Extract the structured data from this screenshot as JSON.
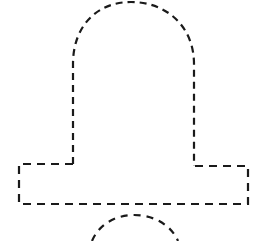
{
  "canvas": {
    "width": 268,
    "height": 241,
    "background_color": "#ffffff",
    "title": "Bell Outline"
  },
  "drawing": {
    "name": "bell-outline",
    "description": "Dashed outline drawing of a bell",
    "style": {
      "stroke_color": "#1a1a1a",
      "stroke_width": 2.2,
      "dash_pattern": "7 5",
      "fill": "none"
    },
    "shapes": {
      "dome": {
        "name": "bell-dome",
        "path": "M 73 164 L 73 64 C 73 26 97 2 131 2 C 166 2 194 26 194 64 L 194 166",
        "dash_pattern": "7 5"
      },
      "base_flange": {
        "name": "bell-base-flange",
        "path": "M 73 164 L 19 164 L 19 204 L 248 204 L 248 166 L 194 166",
        "dash_pattern": "8 6"
      },
      "clapper": {
        "name": "bell-clapper",
        "path": "M 92 241 C 99 224 116 215 134 215 C 154 215 171 225 178 241",
        "dash_pattern": "7 6"
      }
    }
  }
}
